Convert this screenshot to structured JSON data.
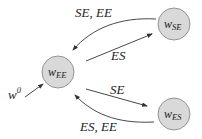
{
  "diagram": {
    "type": "state-transition-graph",
    "nodes": [
      {
        "id": "w_EE",
        "base": "w",
        "subscript": "EE",
        "cx": 58,
        "cy": 72,
        "r": 16
      },
      {
        "id": "w_SE",
        "base": "w",
        "subscript": "SE",
        "cx": 174,
        "cy": 24,
        "r": 16
      },
      {
        "id": "w_ES",
        "base": "w",
        "subscript": "ES",
        "cx": 174,
        "cy": 114,
        "r": 16
      }
    ],
    "edges": [
      {
        "from": "w_SE",
        "to": "w_EE",
        "label": "SE, EE",
        "style": "curved"
      },
      {
        "from": "w_EE",
        "to": "w_SE",
        "label": "ES",
        "style": "straight"
      },
      {
        "from": "w_EE",
        "to": "w_ES",
        "label": "SE",
        "style": "straight"
      },
      {
        "from": "w_ES",
        "to": "w_EE",
        "label": "ES, EE",
        "style": "curved"
      }
    ],
    "initial": {
      "to": "w_EE",
      "label_base": "w",
      "label_sup": "0"
    }
  },
  "labels": {
    "node_ee_base": "w",
    "node_ee_sub": "EE",
    "node_se_base": "w",
    "node_se_sub": "SE",
    "node_es_base": "w",
    "node_es_sub": "ES",
    "edge_se_to_ee": "SE, EE",
    "edge_ee_to_se": "ES",
    "edge_ee_to_es": "SE",
    "edge_es_to_ee": "ES, EE",
    "initial_base": "w",
    "initial_sup": "0"
  },
  "colors": {
    "node_fill": "#d9d9d9",
    "node_stroke": "#8a8a8a",
    "edge": "#333333",
    "text": "#222222"
  }
}
